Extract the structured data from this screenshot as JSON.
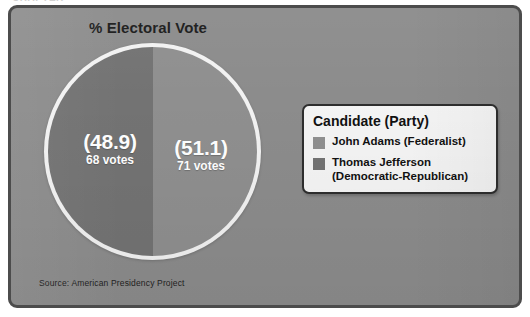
{
  "page": {
    "header_sliver_text": "CHAPTER"
  },
  "chart": {
    "title": "% Electoral Vote",
    "source_note": "Source: American Presidency Project"
  },
  "legend": {
    "title": "Candidate (Party)",
    "items": [
      {
        "label": "John Adams (Federalist)",
        "color": "#8f8f8f",
        "swatch_name": "legend-swatch-adams"
      },
      {
        "label": "Thomas Jefferson (Democratic-Republican)",
        "color": "#737373",
        "swatch_name": "legend-swatch-jefferson"
      }
    ]
  },
  "slices": [
    {
      "pct_label": "(48.9)",
      "votes_label": "68 votes"
    },
    {
      "pct_label": "(51.1)",
      "votes_label": "71 votes"
    }
  ],
  "colors": {
    "background": "#8c8c8c",
    "frame_border": "#4c4c4c",
    "pie_ring": "#f2f2f2",
    "slice_jefferson": "#737373",
    "slice_adams": "#8f8f8f",
    "legend_background": "#f4f4f4",
    "legend_border": "#2e2e2e",
    "text_dark": "#111111",
    "text_light": "#ffffff"
  },
  "chart_data": {
    "type": "pie",
    "title": "% Electoral Vote",
    "categories": [
      "John Adams (Federalist)",
      "Thomas Jefferson (Democratic-Republican)"
    ],
    "values": [
      51.1,
      48.9
    ],
    "value_unit": "percent of electoral vote",
    "raw_votes": [
      71,
      68
    ],
    "data_labels": [
      "(51.1) 71 votes",
      "(48.9) 68 votes"
    ],
    "slice_colors": [
      "#8f8f8f",
      "#737373"
    ],
    "legend_position": "right",
    "legend_title": "Candidate (Party)",
    "grid": false,
    "source": "Source: American Presidency Project"
  }
}
